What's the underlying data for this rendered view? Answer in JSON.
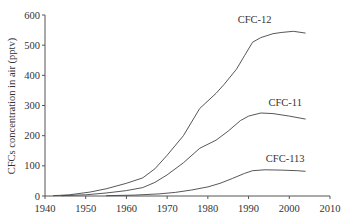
{
  "chart_data": {
    "type": "line",
    "title": "",
    "xlabel": "",
    "ylabel": "CFCs concentration in air (pptv)",
    "xlim": [
      1940,
      2010
    ],
    "ylim": [
      0,
      600
    ],
    "xticks": [
      1940,
      1950,
      1960,
      1970,
      1980,
      1990,
      2000,
      2010
    ],
    "yticks": [
      0,
      100,
      200,
      300,
      400,
      500,
      600
    ],
    "grid": false,
    "legend": "inline labels",
    "series": [
      {
        "name": "CFC-12",
        "label_pos": [
          1991.5,
          572
        ],
        "points": [
          [
            1942,
            1
          ],
          [
            1946,
            4
          ],
          [
            1951,
            13
          ],
          [
            1955,
            24
          ],
          [
            1960,
            42
          ],
          [
            1964,
            60
          ],
          [
            1967,
            90
          ],
          [
            1970,
            135
          ],
          [
            1974,
            200
          ],
          [
            1978,
            290
          ],
          [
            1982,
            340
          ],
          [
            1984,
            370
          ],
          [
            1987,
            420
          ],
          [
            1989,
            465
          ],
          [
            1991,
            510
          ],
          [
            1993,
            525
          ],
          [
            1996,
            538
          ],
          [
            1998,
            542
          ],
          [
            2001,
            546
          ],
          [
            2004,
            540
          ]
        ]
      },
      {
        "name": "CFC-11",
        "label_pos": [
          1999,
          300
        ],
        "points": [
          [
            1944,
            1
          ],
          [
            1950,
            4
          ],
          [
            1955,
            10
          ],
          [
            1960,
            18
          ],
          [
            1964,
            28
          ],
          [
            1967,
            45
          ],
          [
            1970,
            70
          ],
          [
            1974,
            110
          ],
          [
            1978,
            158
          ],
          [
            1982,
            185
          ],
          [
            1985,
            215
          ],
          [
            1988,
            250
          ],
          [
            1990,
            265
          ],
          [
            1993,
            275
          ],
          [
            1996,
            273
          ],
          [
            2000,
            265
          ],
          [
            2004,
            255
          ]
        ]
      },
      {
        "name": "CFC-113",
        "label_pos": [
          1999,
          112
        ],
        "points": [
          [
            1955,
            1
          ],
          [
            1962,
            3
          ],
          [
            1968,
            7
          ],
          [
            1972,
            12
          ],
          [
            1976,
            20
          ],
          [
            1980,
            30
          ],
          [
            1983,
            42
          ],
          [
            1986,
            58
          ],
          [
            1989,
            75
          ],
          [
            1991,
            84
          ],
          [
            1994,
            87
          ],
          [
            1998,
            86
          ],
          [
            2002,
            84
          ],
          [
            2004,
            82
          ]
        ]
      }
    ]
  },
  "labels": {
    "ylabel": "CFCs concentration in air (pptv)"
  }
}
